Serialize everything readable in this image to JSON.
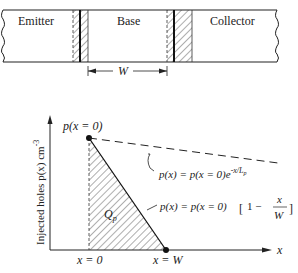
{
  "device": {
    "regions": [
      "Emitter",
      "Base",
      "Collector"
    ],
    "width_label": "W"
  },
  "plot": {
    "y_axis_label": "Injected holes p(x) cm",
    "y_axis_exp": "-3",
    "x_axis_label": "x",
    "peak_label": "p(x = 0)",
    "area_label": "Q",
    "area_sub": "p",
    "x0_label": "x = 0",
    "xw_label": "x = W",
    "exp_eq": "p(x) = p(x = 0)e",
    "exp_eq_sup": "-x/L",
    "exp_eq_sup_sub": "p",
    "lin_eq": "p(x) = p(x = 0)",
    "lin_eq_bracket": "1 −",
    "lin_eq_num": "x",
    "lin_eq_den": "W"
  }
}
